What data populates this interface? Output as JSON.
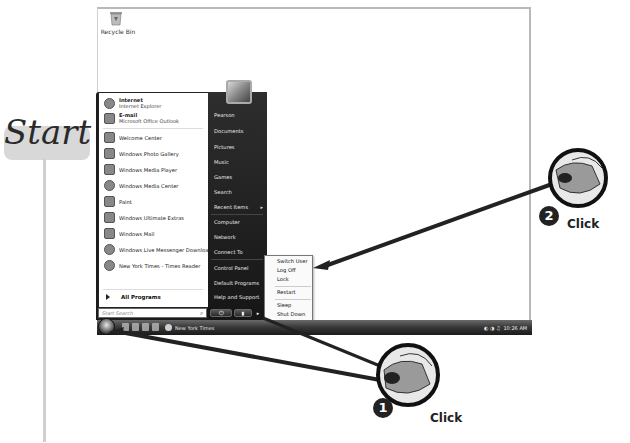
{
  "callout_label": {
    "title": "Start"
  },
  "desktop": {
    "icons": [
      {
        "label": "Recycle Bin",
        "icon": "recycle-bin-icon"
      }
    ]
  },
  "start_menu": {
    "pinned": [
      {
        "title": "Internet",
        "subtitle": "Internet Explorer",
        "icon": "internet-explorer-icon"
      },
      {
        "title": "E-mail",
        "subtitle": "Microsoft Office Outlook",
        "icon": "outlook-icon"
      }
    ],
    "recent": [
      {
        "label": "Welcome Center",
        "icon": "welcome-center-icon"
      },
      {
        "label": "Windows Photo Gallery",
        "icon": "photo-gallery-icon"
      },
      {
        "label": "Windows Media Player",
        "icon": "media-player-icon"
      },
      {
        "label": "Windows Media Center",
        "icon": "media-center-icon"
      },
      {
        "label": "Paint",
        "icon": "paint-icon"
      },
      {
        "label": "Windows Ultimate Extras",
        "icon": "ultimate-extras-icon"
      },
      {
        "label": "Windows Mail",
        "icon": "mail-icon"
      },
      {
        "label": "Windows Live Messenger Download",
        "icon": "messenger-icon"
      },
      {
        "label": "New York Times - Times Reader",
        "icon": "times-reader-icon"
      }
    ],
    "all_programs": "All Programs",
    "search_placeholder": "Start Search",
    "right_items": [
      {
        "label": "Pearson"
      },
      {
        "label": "Documents"
      },
      {
        "label": "Pictures"
      },
      {
        "label": "Music"
      },
      {
        "label": "Games"
      },
      {
        "label": "Search"
      },
      {
        "label": "Recent Items",
        "has_submenu": true
      },
      {
        "label": "Computer"
      },
      {
        "label": "Network"
      },
      {
        "label": "Connect To"
      },
      {
        "label": "Control Panel"
      },
      {
        "label": "Default Programs"
      },
      {
        "label": "Help and Support"
      }
    ],
    "power_glyph": "⏻",
    "lock_glyph": "▮",
    "more_glyph": "▸"
  },
  "shutdown_menu": {
    "items": [
      "Switch User",
      "Log Off",
      "Lock",
      "Restart",
      "Sleep",
      "Shut Down"
    ]
  },
  "taskbar": {
    "task_button": "New York Times",
    "tray": "◐ ◑ ♫",
    "clock": "10:26 AM"
  },
  "annotations": {
    "step1": {
      "number": "1",
      "label": "Click"
    },
    "step2": {
      "number": "2",
      "label": "Click"
    }
  }
}
